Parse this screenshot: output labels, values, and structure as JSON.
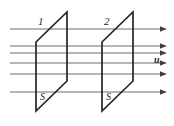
{
  "figure": {
    "caption_type": "flux-through-two-parallel-surfaces",
    "width": 174,
    "height": 126,
    "background_color": "#ffffff",
    "line_color": "#6e6e6e",
    "outline_color": "#262626",
    "arrow_color": "#3d3d3d",
    "text_color": "#2b2b2b"
  },
  "labels": {
    "surface_one_index": "1",
    "surface_two_index": "2",
    "surface_one_area": "S",
    "surface_two_area": "S",
    "velocity_vector": "u"
  },
  "surfaces": [
    {
      "name": "surface-one",
      "index_label": "1",
      "area_label": "S",
      "points": "36,42 67,12 67,81 36,111"
    },
    {
      "name": "surface-two",
      "index_label": "2",
      "area_label": "S",
      "points": "102,42 133,12 133,81 102,111"
    }
  ],
  "flow_lines": [
    {
      "y": 29,
      "x1": 10,
      "x2": 166
    },
    {
      "y": 46,
      "x1": 10,
      "x2": 166
    },
    {
      "y": 53,
      "x1": 10,
      "x2": 166
    },
    {
      "y": 63,
      "x1": 10,
      "x2": 166
    },
    {
      "y": 74,
      "x1": 10,
      "x2": 166
    },
    {
      "y": 92,
      "x1": 10,
      "x2": 166
    }
  ],
  "label_positions": {
    "surface_one_index": {
      "x": 38,
      "y": 16
    },
    "surface_two_index": {
      "x": 104,
      "y": 16
    },
    "surface_one_area": {
      "x": 40,
      "y": 92
    },
    "surface_two_area": {
      "x": 106,
      "y": 92
    },
    "velocity_vector": {
      "x": 154,
      "y": 55
    }
  }
}
